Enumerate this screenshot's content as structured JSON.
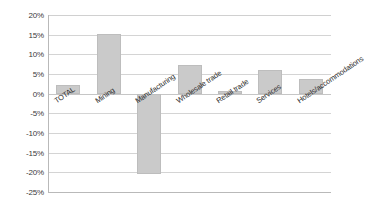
{
  "chart_data": {
    "type": "bar",
    "title": "",
    "subtitle": "",
    "xlabel": "",
    "ylabel": "",
    "categories": [
      "TOTAL",
      "Mining",
      "Manufacturing",
      "Wholesale trade",
      "Retail trade",
      "Services",
      "Hotels/accommodations"
    ],
    "values": [
      2.1,
      15.1,
      -20.3,
      7.3,
      0.7,
      6.0,
      3.7
    ],
    "value_suffix": "%",
    "ylim": [
      -25,
      20
    ],
    "ytick_labels": [
      "20%",
      "15%",
      "10%",
      "5%",
      "0%",
      "-5%",
      "-10%",
      "-15%",
      "-20%",
      "-25%"
    ],
    "ytick_values": [
      20,
      15,
      10,
      5,
      0,
      -5,
      -10,
      -15,
      -20,
      -25
    ],
    "grid": true,
    "legend": false,
    "legend_position": "none",
    "bar_color": "#cacaca",
    "bar_border_color": "#bdbdbd",
    "grid_color": "#d4d4d4",
    "axis_color": "#b9b9b9",
    "text_color": "#2f2f2f",
    "background": "#ffffff",
    "label_rotation_deg": -34
  }
}
